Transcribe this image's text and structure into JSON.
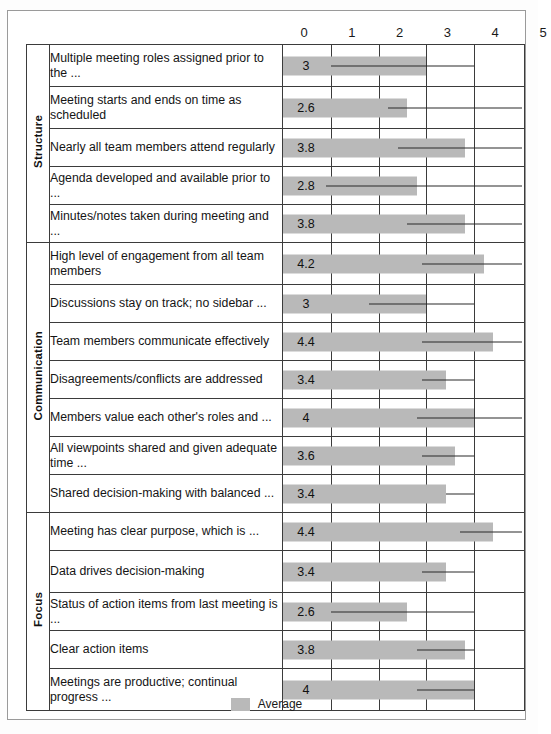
{
  "chart_data": {
    "type": "bar",
    "title": "",
    "xlabel": "",
    "ylabel": "",
    "orientation": "horizontal",
    "xlim": [
      0,
      5
    ],
    "xticks": [
      0,
      1,
      2,
      3,
      4,
      5
    ],
    "grid": true,
    "legend": {
      "position": "bottom",
      "entries": [
        "Average"
      ]
    },
    "series": [
      {
        "name": "Average",
        "color": "#b9b9b9"
      }
    ],
    "groups": [
      {
        "name": "Structure",
        "items": [
          {
            "label": "Multiple meeting roles assigned prior to the ...",
            "value": 3,
            "value_label": "3",
            "error_from": 1.0,
            "error_to": 4.0
          },
          {
            "label": "Meeting starts and ends on time as scheduled",
            "value": 2.6,
            "value_label": "2.6",
            "error_from": 2.2,
            "error_to": 5.0
          },
          {
            "label": "Nearly all team members attend regularly",
            "value": 3.8,
            "value_label": "3.8",
            "error_from": 2.4,
            "error_to": 5.0
          },
          {
            "label": "Agenda developed and available prior to ...",
            "value": 2.8,
            "value_label": "2.8",
            "error_from": 0.9,
            "error_to": 5.0
          },
          {
            "label": "Minutes/notes taken during meeting and ...",
            "value": 3.8,
            "value_label": "3.8",
            "error_from": 2.6,
            "error_to": 5.0
          }
        ]
      },
      {
        "name": "Communication",
        "items": [
          {
            "label": "High level of engagement from all team members",
            "value": 4.2,
            "value_label": "4.2",
            "error_from": 2.9,
            "error_to": 5.0
          },
          {
            "label": "Discussions stay on track; no sidebar ...",
            "value": 3,
            "value_label": "3",
            "error_from": 1.8,
            "error_to": 4.0
          },
          {
            "label": "Team members communicate effectively",
            "value": 4.4,
            "value_label": "4.4",
            "error_from": 2.9,
            "error_to": 5.0
          },
          {
            "label": "Disagreements/conflicts are addressed",
            "value": 3.4,
            "value_label": "3.4",
            "error_from": 2.9,
            "error_to": 4.0
          },
          {
            "label": "Members value each other's roles and ...",
            "value": 4,
            "value_label": "4",
            "error_from": 2.8,
            "error_to": 5.0
          },
          {
            "label": "All viewpoints shared and given adequate time ...",
            "value": 3.6,
            "value_label": "3.6",
            "error_from": 2.9,
            "error_to": 4.0
          },
          {
            "label": "Shared decision-making with balanced ...",
            "value": 3.4,
            "value_label": "3.4",
            "error_from": 3.4,
            "error_to": 4.0
          }
        ]
      },
      {
        "name": "Focus",
        "items": [
          {
            "label": "Meeting has clear purpose, which is ...",
            "value": 4.4,
            "value_label": "4.4",
            "error_from": 3.7,
            "error_to": 5.0
          },
          {
            "label": "Data drives decision-making",
            "value": 3.4,
            "value_label": "3.4",
            "error_from": 2.9,
            "error_to": 4.0
          },
          {
            "label": "Status of action items from last meeting is ...",
            "value": 2.6,
            "value_label": "2.6",
            "error_from": 1.0,
            "error_to": 4.0
          },
          {
            "label": "Clear action items",
            "value": 3.8,
            "value_label": "3.8",
            "error_from": 2.8,
            "error_to": 4.0
          },
          {
            "label": "Meetings are productive; continual progress ...",
            "value": 4,
            "value_label": "4",
            "error_from": 2.8,
            "error_to": 4.0
          }
        ]
      }
    ]
  },
  "legend": {
    "label": "Average"
  }
}
